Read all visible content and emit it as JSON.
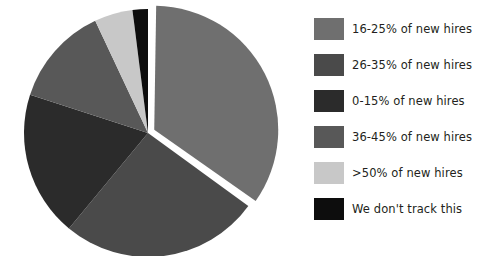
{
  "chart_data": {
    "type": "pie",
    "title": "",
    "subtitle": "",
    "xlabel": "",
    "ylabel": "",
    "grid": false,
    "legend_position": "right",
    "start_angle_deg": 0,
    "direction": "clockwise",
    "background_color": "#ffffff",
    "slice_gap_color": "#ffffff",
    "categories": [
      "16-25% of new hires",
      "26-35% of new hires",
      "0-15% of new hires",
      "36-45% of new hires",
      ">50% of new hires",
      "We don't track this"
    ],
    "values": [
      35,
      26,
      19,
      13,
      5,
      2
    ],
    "colors": [
      "#6f6f6f",
      "#4a4a4a",
      "#2b2b2b",
      "#585858",
      "#c8c8c8",
      "#0d0d0d"
    ],
    "exploded": [
      true,
      false,
      false,
      false,
      false,
      false
    ]
  },
  "legend": {
    "items": [
      {
        "label": "16-25% of new hires",
        "color": "#6f6f6f"
      },
      {
        "label": "26-35% of new hires",
        "color": "#4a4a4a"
      },
      {
        "label": "0-15% of new hires",
        "color": "#2b2b2b"
      },
      {
        "label": "36-45% of new hires",
        "color": "#585858"
      },
      {
        "label": ">50% of new hires",
        "color": "#c8c8c8"
      },
      {
        "label": "We don't track this",
        "color": "#0d0d0d"
      }
    ]
  }
}
